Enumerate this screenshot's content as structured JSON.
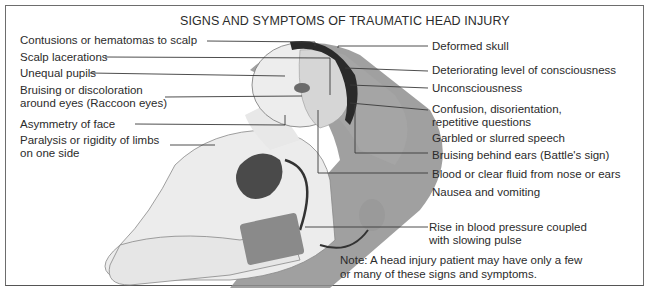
{
  "title": "SIGNS AND SYMPTOMS OF TRAUMATIC HEAD INJURY",
  "left_labels": [
    {
      "text": "Contusions or hematomas to scalp"
    },
    {
      "text": "Scalp lacerations"
    },
    {
      "text": "Unequal pupils"
    },
    {
      "line1": "Bruising or discoloration",
      "line2": "around eyes (Raccoon eyes)"
    },
    {
      "text": "Asymmetry of face"
    },
    {
      "line1": "Paralysis or rigidity of limbs",
      "line2": "on one side"
    }
  ],
  "right_labels": [
    {
      "text": "Deformed skull"
    },
    {
      "text": "Deteriorating level of consciousness"
    },
    {
      "text": "Unconsciousness"
    },
    {
      "line1": "Confusion, disorientation,",
      "line2": "repetitive questions"
    },
    {
      "text": "Garbled or slurred speech"
    },
    {
      "text": "Bruising behind ears (Battle's sign)"
    },
    {
      "text": "Blood or clear fluid from nose or ears"
    },
    {
      "text": "Nausea and vomiting"
    },
    {
      "line1": "Rise in blood pressure coupled",
      "line2": "with slowing pulse"
    }
  ],
  "note": {
    "line1": "Note: A head injury patient may have only a few",
    "line2": "or many of these signs and symptoms."
  },
  "colors": {
    "stretcher": "#8f8f8f",
    "skin": "#e9e9e9",
    "hair": "#2a2a2a",
    "brain": "#d7d7d7",
    "heart": "#4a4a4a",
    "line": "#3a3a3a"
  }
}
